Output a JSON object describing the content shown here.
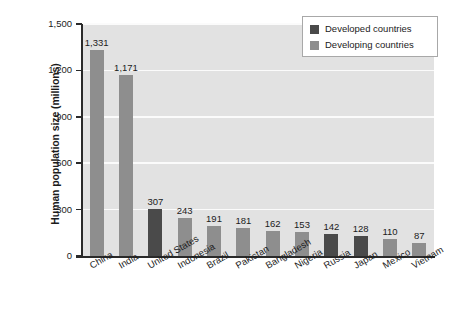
{
  "chart_data": {
    "type": "bar",
    "title": "",
    "xlabel": "",
    "ylabel": "Human population size (millions)",
    "ylim": [
      0,
      1500
    ],
    "yticks": [
      0,
      300,
      600,
      900,
      1200,
      1500
    ],
    "ytick_labels": [
      "0",
      "300",
      "600",
      "900",
      "1,200",
      "1,500"
    ],
    "grid": "horizontal",
    "legend_position": "top-right",
    "categories": [
      "China",
      "India",
      "United States",
      "Indonesia",
      "Brazil",
      "Pakistan",
      "Bangladesh",
      "Nigeria",
      "Russia",
      "Japan",
      "Mexico",
      "Vietnam"
    ],
    "values": [
      1331,
      1171,
      307,
      243,
      191,
      181,
      162,
      153,
      142,
      128,
      110,
      87
    ],
    "value_labels": [
      "1,331",
      "1,171",
      "307",
      "243",
      "191",
      "181",
      "162",
      "153",
      "142",
      "128",
      "110",
      "87"
    ],
    "groups": [
      "developing",
      "developing",
      "developed",
      "developing",
      "developing",
      "developing",
      "developing",
      "developing",
      "developed",
      "developed",
      "developing",
      "developing"
    ],
    "series": [
      {
        "name": "Developed countries",
        "color": "#4a4a4a",
        "points": [
          {
            "category": "United States",
            "value": 307
          },
          {
            "category": "Russia",
            "value": 142
          },
          {
            "category": "Japan",
            "value": 128
          }
        ]
      },
      {
        "name": "Developing countries",
        "color": "#8e8e8e",
        "points": [
          {
            "category": "China",
            "value": 1331
          },
          {
            "category": "India",
            "value": 1171
          },
          {
            "category": "Indonesia",
            "value": 243
          },
          {
            "category": "Brazil",
            "value": 191
          },
          {
            "category": "Pakistan",
            "value": 181
          },
          {
            "category": "Bangladesh",
            "value": 162
          },
          {
            "category": "Nigeria",
            "value": 153
          },
          {
            "category": "Mexico",
            "value": 110
          },
          {
            "category": "Vietnam",
            "value": 87
          }
        ]
      }
    ]
  },
  "legend": {
    "items": [
      {
        "label": "Developed countries",
        "group": "developed"
      },
      {
        "label": "Developing countries",
        "group": "developing"
      }
    ]
  },
  "colors": {
    "developed": "#4a4a4a",
    "developing": "#8e8e8e",
    "plot_background": "#e2e2e2",
    "gridline": "#fbfbfb",
    "axis": "#2a2a2a",
    "text": "#1b1b1b"
  }
}
